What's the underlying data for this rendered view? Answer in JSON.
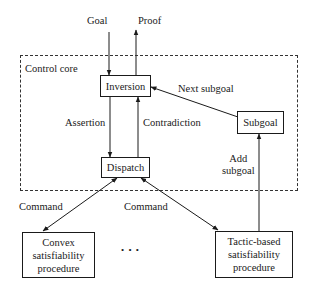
{
  "diagram": {
    "container": {
      "label": "Control core"
    },
    "inputs": {
      "goal": "Goal",
      "proof": "Proof"
    },
    "nodes": {
      "inversion": "Inversion",
      "subgoal": "Subgoal",
      "dispatch": "Dispatch",
      "convex": [
        "Convex",
        "satisfiability",
        "procedure"
      ],
      "tactic": [
        "Tactic-based",
        "satisfiability",
        "procedure"
      ]
    },
    "edges": {
      "assertion": "Assertion",
      "contradiction": "Contradiction",
      "next_subgoal": "Next subgoal",
      "add_subgoal": [
        "Add",
        "subgoal"
      ],
      "command_left": "Command",
      "command_right": "Command"
    },
    "ellipsis": "• • •"
  }
}
